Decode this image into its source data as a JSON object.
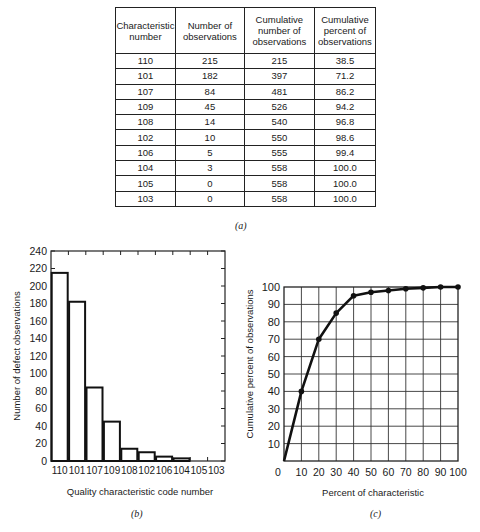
{
  "table": {
    "caption": "(a)",
    "headers": [
      "Characteristic number",
      "Number of observations",
      "Cumulative number of observations",
      "Cumulative percent of observations"
    ],
    "header_lines": [
      [
        "Characteristic",
        "number"
      ],
      [
        "Number of",
        "observations"
      ],
      [
        "Cumulative",
        "number of",
        "observations"
      ],
      [
        "Cumulative",
        "percent of",
        "observations"
      ]
    ],
    "rows": [
      [
        "110",
        "215",
        "215",
        "38.5"
      ],
      [
        "101",
        "182",
        "397",
        "71.2"
      ],
      [
        "107",
        "84",
        "481",
        "86.2"
      ],
      [
        "109",
        "45",
        "526",
        "94.2"
      ],
      [
        "108",
        "14",
        "540",
        "96.8"
      ],
      [
        "102",
        "10",
        "550",
        "98.6"
      ],
      [
        "106",
        "5",
        "555",
        "99.4"
      ],
      [
        "104",
        "3",
        "558",
        "100.0"
      ],
      [
        "105",
        "0",
        "558",
        "100.0"
      ],
      [
        "103",
        "0",
        "558",
        "100.0"
      ]
    ]
  },
  "chart_data": [
    {
      "type": "bar",
      "caption": "(b)",
      "title": "",
      "xlabel": "Quality characteristic code number",
      "ylabel": "Number of defect observations",
      "categories": [
        "110",
        "101",
        "107",
        "109",
        "108",
        "102",
        "106",
        "104",
        "105",
        "103"
      ],
      "values": [
        215,
        182,
        84,
        45,
        14,
        10,
        5,
        3,
        0,
        0
      ],
      "ylim": [
        0,
        240
      ],
      "yticks": [
        0,
        20,
        40,
        60,
        80,
        100,
        120,
        140,
        160,
        180,
        200,
        220,
        240
      ],
      "grid": false,
      "legend": null
    },
    {
      "type": "line",
      "caption": "(c)",
      "title": "",
      "xlabel": "Percent of characteristic",
      "ylabel": "Cumulative percent of observations",
      "x": [
        0,
        10,
        20,
        30,
        40,
        50,
        60,
        70,
        80,
        90,
        100
      ],
      "values": [
        0,
        40,
        70,
        85,
        95,
        97,
        98,
        99,
        99.5,
        100,
        100
      ],
      "xlim": [
        0,
        100
      ],
      "ylim": [
        0,
        100
      ],
      "xticks": [
        0,
        10,
        20,
        30,
        40,
        50,
        60,
        70,
        80,
        90,
        100
      ],
      "yticks": [
        10,
        20,
        30,
        40,
        50,
        60,
        70,
        80,
        90,
        100
      ],
      "grid": true,
      "markers": true,
      "legend": null
    }
  ]
}
